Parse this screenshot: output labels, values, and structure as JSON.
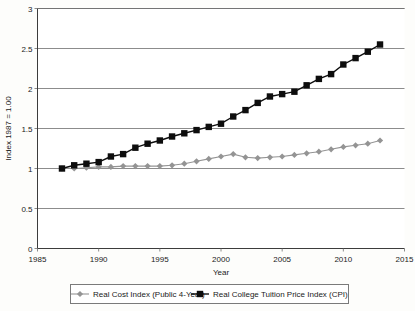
{
  "chart_data": {
    "type": "line",
    "title": "",
    "xlabel": "Year",
    "ylabel": "Index 1987 = 1.00",
    "xlim": [
      1985,
      2015
    ],
    "ylim": [
      0,
      3
    ],
    "grid": true,
    "legend_position": "bottom",
    "xticks": [
      1985,
      1990,
      1995,
      2000,
      2005,
      2010,
      2015
    ],
    "yticks": [
      0,
      0.5,
      1,
      1.5,
      2,
      2.5,
      3
    ],
    "xtick_labels": [
      "1985",
      "1990",
      "1995",
      "2000",
      "2005",
      "2010",
      "2015"
    ],
    "ytick_labels": [
      "0",
      "0.5",
      "1",
      "1.5",
      "2",
      "2.5",
      "3"
    ],
    "x": [
      1987,
      1988,
      1989,
      1990,
      1991,
      1992,
      1993,
      1994,
      1995,
      1996,
      1997,
      1998,
      1999,
      2000,
      2001,
      2002,
      2003,
      2004,
      2005,
      2006,
      2007,
      2008,
      2009,
      2010,
      2011,
      2012,
      2013
    ],
    "series": [
      {
        "name": "Real Cost Index (Public 4-Year)",
        "color": "#949494",
        "marker": "diamond",
        "values": [
          1.0,
          1.0,
          1.01,
          1.02,
          1.02,
          1.03,
          1.03,
          1.03,
          1.03,
          1.04,
          1.06,
          1.09,
          1.12,
          1.15,
          1.18,
          1.14,
          1.13,
          1.14,
          1.15,
          1.17,
          1.19,
          1.21,
          1.24,
          1.27,
          1.29,
          1.31,
          1.35
        ]
      },
      {
        "name": "Real College Tuition Price Index (CPI)",
        "color": "#0d0d0d",
        "marker": "square",
        "values": [
          1.0,
          1.04,
          1.06,
          1.08,
          1.15,
          1.18,
          1.26,
          1.31,
          1.35,
          1.4,
          1.44,
          1.48,
          1.52,
          1.56,
          1.65,
          1.73,
          1.82,
          1.9,
          1.93,
          1.96,
          2.04,
          2.12,
          2.18,
          2.3,
          2.38,
          2.46,
          2.55
        ]
      }
    ]
  },
  "legend": {
    "entries": [
      {
        "label": "Real Cost Index (Public 4-Year)"
      },
      {
        "label": "Real College Tuition Price Index (CPI)"
      }
    ]
  }
}
